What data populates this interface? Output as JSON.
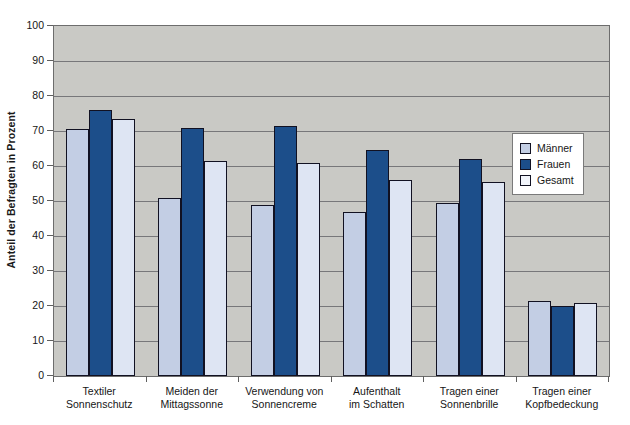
{
  "chart_data": {
    "type": "bar",
    "title": "",
    "xlabel": "",
    "ylabel": "Anteil der Befragten in Prozent",
    "ylim": [
      0,
      100
    ],
    "yticks": [
      0,
      10,
      20,
      30,
      40,
      50,
      60,
      70,
      80,
      90,
      100
    ],
    "grid": true,
    "legend_position": "right",
    "categories": [
      "Textiler\nSonnenschutz",
      "Meiden der\nMittagssonne",
      "Verwendung von\nSonnencreme",
      "Aufenthalt\nim Schatten",
      "Tragen einer\nSonnenbrille",
      "Tragen einer\nKopfbedeckung"
    ],
    "category_lines": [
      [
        "Textiler",
        "Sonnenschutz"
      ],
      [
        "Meiden der",
        "Mittagssonne"
      ],
      [
        "Verwendung von",
        "Sonnencreme"
      ],
      [
        "Aufenthalt",
        "im Schatten"
      ],
      [
        "Tragen einer",
        "Sonnenbrille"
      ],
      [
        "Tragen einer",
        "Kopfbedeckung"
      ]
    ],
    "series": [
      {
        "name": "Männer",
        "color": "#c3cee4",
        "values": [
          70.5,
          51,
          49,
          47,
          49.5,
          21.5
        ]
      },
      {
        "name": "Frauen",
        "color": "#1c4e8a",
        "values": [
          76,
          71,
          71.5,
          64.5,
          62,
          20
        ]
      },
      {
        "name": "Gesamt",
        "color": "#dee5f3",
        "values": [
          73.5,
          61.5,
          61,
          56,
          55.5,
          21
        ]
      }
    ]
  },
  "legend": {
    "items": [
      {
        "label": "Männer"
      },
      {
        "label": "Frauen"
      },
      {
        "label": "Gesamt"
      }
    ]
  },
  "axes": {
    "y_title": "Anteil der Befragten in Prozent",
    "y_tick_labels": [
      "100",
      "90",
      "80",
      "70",
      "60",
      "50",
      "40",
      "30",
      "20",
      "10",
      "0"
    ]
  },
  "colors": {
    "plot_background": "#c9c9c5",
    "gridline": "#77777a",
    "series_maenner": "#c3cee4",
    "series_frauen": "#1c4e8a",
    "series_gesamt": "#dee5f3",
    "bar_outline": "#111122"
  }
}
